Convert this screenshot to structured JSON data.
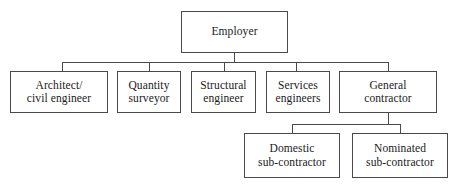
{
  "diagram": {
    "type": "organizational-hierarchy",
    "background_color": "#ffffff",
    "line_color": "#4a4a4a",
    "text_color": "#1a1a1a"
  },
  "nodes": {
    "root": {
      "id": "employer",
      "label": "Employer",
      "x": 181,
      "y": 11,
      "w": 107,
      "h": 42
    },
    "level2": [
      {
        "id": "architect-civil-engineer",
        "label": "Architect/\ncivil engineer",
        "x": 10,
        "y": 71,
        "w": 98,
        "h": 42
      },
      {
        "id": "quantity-surveyor",
        "label": "Quantity\nsurveyor",
        "x": 117,
        "y": 71,
        "w": 64,
        "h": 42
      },
      {
        "id": "structural-engineer",
        "label": "Structural\nengineer",
        "x": 191,
        "y": 71,
        "w": 65,
        "h": 42
      },
      {
        "id": "services-engineers",
        "label": "Services\nengineers",
        "x": 266,
        "y": 71,
        "w": 64,
        "h": 42
      },
      {
        "id": "general-contractor",
        "label": "General\ncontractor",
        "x": 339,
        "y": 71,
        "w": 98,
        "h": 42
      }
    ],
    "level3": [
      {
        "id": "domestic-sub-contractor",
        "label": "Domestic\nsub-contractor",
        "x": 244,
        "y": 133,
        "w": 96,
        "h": 45
      },
      {
        "id": "nominated-sub-contractor",
        "label": "Nominated\nsub-contractor",
        "x": 352,
        "y": 133,
        "w": 96,
        "h": 45
      }
    ]
  },
  "connectors": {
    "root_stem": {
      "x": 234,
      "y": 53,
      "len": 9
    },
    "main_bus": {
      "x": 62,
      "y": 62,
      "len": 327
    },
    "main_drops": [
      {
        "x": 62,
        "y": 62,
        "len": 9
      },
      {
        "x": 149,
        "y": 62,
        "len": 9
      },
      {
        "x": 224,
        "y": 62,
        "len": 9
      },
      {
        "x": 296,
        "y": 62,
        "len": 9
      },
      {
        "x": 388,
        "y": 62,
        "len": 9
      }
    ],
    "gc_stem": {
      "x": 388,
      "y": 113,
      "len": 11
    },
    "sub_bus": {
      "x": 292,
      "y": 124,
      "len": 109
    },
    "sub_drops": [
      {
        "x": 292,
        "y": 124,
        "len": 9
      },
      {
        "x": 400,
        "y": 124,
        "len": 9
      }
    ]
  }
}
